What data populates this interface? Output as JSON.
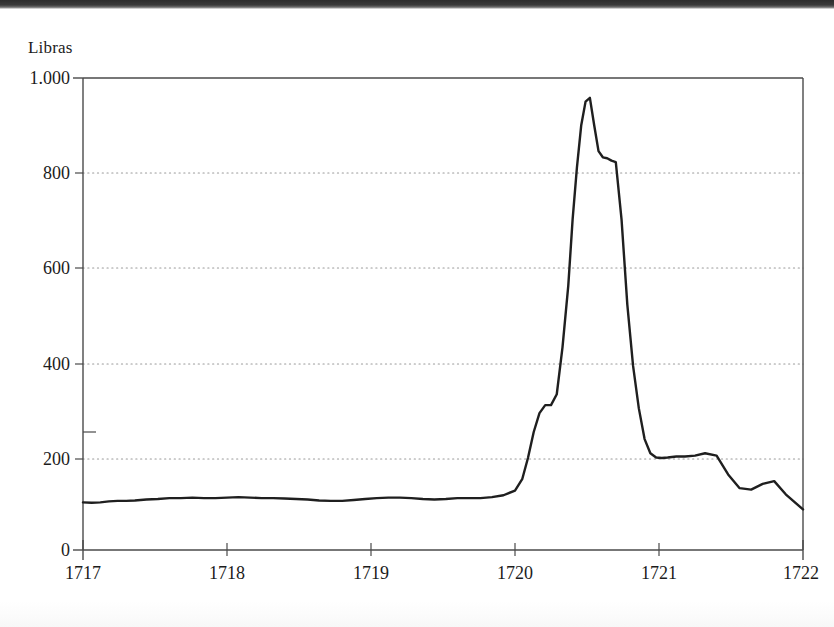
{
  "figure": {
    "axis_title": "Libras",
    "line_color": "#1f1f1f",
    "axis_color": "#4a4a4a",
    "grid_color": "#9a9a9a"
  },
  "chart_data": {
    "type": "line",
    "title": "",
    "subtitle": "",
    "xlabel": "",
    "ylabel": "Libras",
    "ylim": [
      0,
      1000
    ],
    "xlim": [
      1717,
      1722
    ],
    "grid": true,
    "grid_axis": "y",
    "legend": "none",
    "yticks": [
      0,
      200,
      400,
      600,
      800,
      1000
    ],
    "ytick_labels": [
      "0",
      "200",
      "400",
      "600",
      "800",
      "1.000"
    ],
    "xticks": [
      1717,
      1718,
      1719,
      1720,
      1721,
      1722
    ],
    "xtick_labels": [
      "1717",
      "1718",
      "1719",
      "1720",
      "1721",
      "1722"
    ],
    "series": [
      {
        "name": "South Sea Company share price",
        "color": "#1f1f1f",
        "x": [
          1717.0,
          1717.06,
          1717.12,
          1717.18,
          1717.24,
          1717.3,
          1717.36,
          1717.44,
          1717.52,
          1717.6,
          1717.68,
          1717.76,
          1717.84,
          1717.92,
          1718.0,
          1718.08,
          1718.16,
          1718.24,
          1718.32,
          1718.4,
          1718.48,
          1718.56,
          1718.64,
          1718.72,
          1718.8,
          1718.88,
          1718.96,
          1719.04,
          1719.12,
          1719.2,
          1719.28,
          1719.36,
          1719.44,
          1719.52,
          1719.6,
          1719.68,
          1719.76,
          1719.84,
          1719.92,
          1720.0,
          1720.05,
          1720.09,
          1720.13,
          1720.17,
          1720.21,
          1720.25,
          1720.29,
          1720.33,
          1720.37,
          1720.4,
          1720.43,
          1720.46,
          1720.49,
          1720.52,
          1720.55,
          1720.58,
          1720.61,
          1720.64,
          1720.67,
          1720.7,
          1720.74,
          1720.78,
          1720.82,
          1720.86,
          1720.9,
          1720.94,
          1720.98,
          1721.02,
          1721.06,
          1721.12,
          1721.18,
          1721.25,
          1721.32,
          1721.4,
          1721.48,
          1721.56,
          1721.64,
          1721.72,
          1721.8,
          1721.88,
          1722.0
        ],
        "y": [
          101,
          100,
          101,
          103,
          104,
          104,
          105,
          107,
          108,
          110,
          110,
          111,
          110,
          110,
          111,
          112,
          111,
          110,
          110,
          109,
          108,
          107,
          105,
          104,
          104,
          106,
          108,
          110,
          111,
          111,
          110,
          108,
          107,
          108,
          110,
          110,
          110,
          112,
          116,
          126,
          150,
          195,
          250,
          290,
          307,
          307,
          330,
          430,
          560,
          700,
          810,
          900,
          950,
          958,
          900,
          845,
          832,
          830,
          825,
          822,
          700,
          520,
          390,
          300,
          235,
          205,
          196,
          195,
          196,
          198,
          198,
          200,
          205,
          200,
          160,
          131,
          128,
          140,
          146,
          118,
          86
        ]
      }
    ],
    "annotations": []
  },
  "axes": {
    "ytick_positions_px": [
      550,
      459,
      364,
      268,
      173,
      78
    ],
    "xtick_positions_px": [
      83,
      227,
      371,
      515,
      659,
      803
    ],
    "plot_left_px": 83,
    "plot_right_px": 803,
    "plot_top_px": 78,
    "plot_bottom_px": 550
  }
}
